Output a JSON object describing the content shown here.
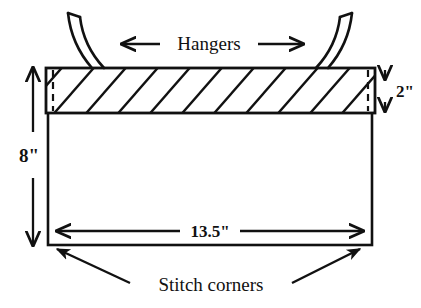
{
  "diagram": {
    "background_color": "#ffffff",
    "line_color": "#111111",
    "panel": {
      "name": "main-rectangle",
      "fill": "#ffffff",
      "stroke": "#111111"
    },
    "band": {
      "name": "hatched-casing-band",
      "fill": "#ffffff",
      "hatch_color": "#111111",
      "hatch_count": 11,
      "hatch_direction": "lower-left-to-upper-right"
    },
    "seam_lines": {
      "name": "dashed-seam-allowance",
      "style": "dashed",
      "count": 2
    },
    "labels": {
      "hangers": "Hangers",
      "stitch_corners": "Stitch corners"
    },
    "dimensions": {
      "band_height": "2\"",
      "panel_height": "8\"",
      "panel_width": "13.5\""
    },
    "hangers": {
      "left_label": "left-hanger-strap",
      "right_label": "right-hanger-strap",
      "count": 2
    },
    "arrows": {
      "hangers_arrow": "double-headed-horizontal",
      "band_height_arrow": "double-headed-vertical",
      "panel_height_arrow": "double-headed-vertical",
      "panel_width_arrow": "double-headed-horizontal",
      "stitch_left_arrow": "single-headed-diagonal",
      "stitch_right_arrow": "single-headed-diagonal"
    }
  }
}
